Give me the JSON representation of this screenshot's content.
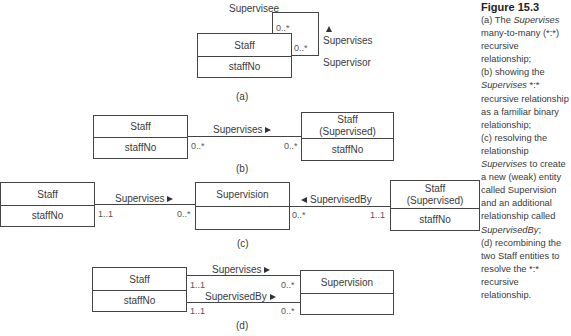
{
  "figure": {
    "title": "Figure 15.3",
    "caption_lines": [
      {
        "parts": [
          {
            "t": "(a) The "
          },
          {
            "t": "Supervises",
            "i": true
          }
        ]
      },
      {
        "parts": [
          {
            "t": "many-to-many (*:*)"
          }
        ]
      },
      {
        "parts": [
          {
            "t": "recursive"
          }
        ]
      },
      {
        "parts": [
          {
            "t": "relationship;"
          }
        ]
      },
      {
        "parts": [
          {
            "t": "(b) showing the"
          }
        ]
      },
      {
        "parts": [
          {
            "t": "Supervises",
            "i": true
          },
          {
            "t": " *:*"
          }
        ]
      },
      {
        "parts": [
          {
            "t": "recursive relationship"
          }
        ]
      },
      {
        "parts": [
          {
            "t": "as a familiar binary"
          }
        ]
      },
      {
        "parts": [
          {
            "t": "relationship;"
          }
        ]
      },
      {
        "parts": [
          {
            "t": "(c) resolving the"
          }
        ]
      },
      {
        "parts": [
          {
            "t": "relationship"
          }
        ]
      },
      {
        "parts": [
          {
            "t": "Supervises",
            "i": true
          },
          {
            "t": " to create"
          }
        ]
      },
      {
        "parts": [
          {
            "t": "a new (weak) entity"
          }
        ]
      },
      {
        "parts": [
          {
            "t": "called Supervision"
          }
        ]
      },
      {
        "parts": [
          {
            "t": "and an additional"
          }
        ]
      },
      {
        "parts": [
          {
            "t": "relationship called"
          }
        ]
      },
      {
        "parts": [
          {
            "t": "SupervisedBy",
            "i": true
          },
          {
            "t": ";"
          }
        ]
      },
      {
        "parts": [
          {
            "t": "(d) recombining the"
          }
        ]
      },
      {
        "parts": [
          {
            "t": "two Staff entities to"
          }
        ]
      },
      {
        "parts": [
          {
            "t": "resolve the *:*"
          }
        ]
      },
      {
        "parts": [
          {
            "t": "recursive"
          }
        ]
      },
      {
        "parts": [
          {
            "t": "relationship."
          }
        ]
      }
    ]
  },
  "diagram_a": {
    "caption": "(a)",
    "entity": {
      "name": "Staff",
      "attribute": "staffNo"
    },
    "role_top": "Supervisee",
    "role_bottom": "Supervisor",
    "relationship": "Supervises",
    "mult_top": "0..*",
    "mult_right": "0..*"
  },
  "diagram_b": {
    "caption": "(b)",
    "left_entity": {
      "name": "Staff",
      "attribute": "staffNo"
    },
    "right_entity": {
      "name": "Staff",
      "name2": "(Supervised)",
      "attribute": "staffNo"
    },
    "relationship": "Supervises",
    "mult_left": "0..*",
    "mult_right": "0..*"
  },
  "diagram_c": {
    "caption": "(c)",
    "left_entity": {
      "name": "Staff",
      "attribute": "staffNo"
    },
    "middle_entity": {
      "name": "Supervision",
      "attribute": ""
    },
    "right_entity": {
      "name": "Staff",
      "name2": "(Supervised)",
      "attribute": "staffNo"
    },
    "rel_left": "Supervises",
    "rel_left_mult_left": "1..1",
    "rel_left_mult_right": "0..*",
    "rel_right": "SupervisedBy",
    "rel_right_mult_left": "0..*",
    "rel_right_mult_right": "1..1"
  },
  "diagram_d": {
    "caption": "(d)",
    "left_entity": {
      "name": "Staff",
      "attribute": "staffNo"
    },
    "right_entity": {
      "name": "Supervision",
      "attribute": ""
    },
    "rel_top": "Supervises",
    "rel_top_mult_left": "1..1",
    "rel_top_mult_right": "0..*",
    "rel_bottom": "SupervisedBy",
    "rel_bottom_mult_left": "1..1",
    "rel_bottom_mult_right": "0..*"
  }
}
